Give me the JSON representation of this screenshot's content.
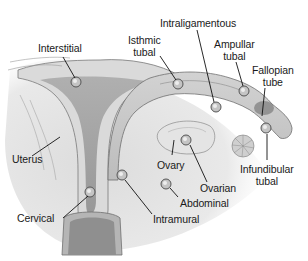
{
  "diagram": {
    "colors": {
      "background": "#ffffff",
      "tissue_light": "#e6e6e6",
      "tissue_mid": "#c8c8c8",
      "tissue_dark": "#8a8a8a",
      "outline": "#6e6e6e",
      "leader_line": "#111111",
      "text": "#1a1a1a"
    },
    "labels": [
      {
        "id": "interstitial",
        "text": "Interstitial"
      },
      {
        "id": "isthmic",
        "line1": "Isthmic",
        "line2": "tubal"
      },
      {
        "id": "intraligamentous",
        "text": "Intraligamentous"
      },
      {
        "id": "ampullar",
        "line1": "Ampullar",
        "line2": "tubal"
      },
      {
        "id": "fallopian",
        "line1": "Fallopian",
        "line2": "tube"
      },
      {
        "id": "uterus",
        "text": "Uterus"
      },
      {
        "id": "ovary",
        "text": "Ovary"
      },
      {
        "id": "ovarian",
        "text": "Ovarian"
      },
      {
        "id": "infundibular",
        "line1": "Infundibular",
        "line2": "tubal"
      },
      {
        "id": "abdominal",
        "text": "Abdominal"
      },
      {
        "id": "cervical",
        "text": "Cervical"
      },
      {
        "id": "intramural",
        "text": "Intramural"
      }
    ]
  }
}
